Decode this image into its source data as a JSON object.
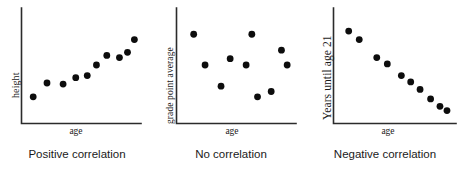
{
  "chart_data": [
    {
      "type": "scatter",
      "title": "Positive correlation",
      "xlabel": "age",
      "ylabel": "height",
      "xlim": [
        0,
        100
      ],
      "ylim": [
        0,
        100
      ],
      "grid": false,
      "legend": "none",
      "points": [
        {
          "x": 8,
          "y": 20
        },
        {
          "x": 20,
          "y": 33
        },
        {
          "x": 34,
          "y": 32
        },
        {
          "x": 45,
          "y": 38
        },
        {
          "x": 55,
          "y": 40
        },
        {
          "x": 63,
          "y": 50
        },
        {
          "x": 72,
          "y": 59
        },
        {
          "x": 83,
          "y": 57
        },
        {
          "x": 90,
          "y": 62
        },
        {
          "x": 96,
          "y": 74
        }
      ]
    },
    {
      "type": "scatter",
      "title": "No correlation",
      "xlabel": "age",
      "ylabel": "grade point average",
      "xlim": [
        0,
        100
      ],
      "ylim": [
        0,
        100
      ],
      "grid": false,
      "legend": "none",
      "points": [
        {
          "x": 12,
          "y": 79
        },
        {
          "x": 22,
          "y": 50
        },
        {
          "x": 36,
          "y": 30
        },
        {
          "x": 44,
          "y": 56
        },
        {
          "x": 58,
          "y": 50
        },
        {
          "x": 63,
          "y": 79
        },
        {
          "x": 68,
          "y": 20
        },
        {
          "x": 80,
          "y": 25
        },
        {
          "x": 89,
          "y": 64
        },
        {
          "x": 94,
          "y": 50
        }
      ]
    },
    {
      "type": "scatter",
      "title": "Negative correlation",
      "xlabel": "age",
      "ylabel": "Years until age 21",
      "xlim": [
        0,
        100
      ],
      "ylim": [
        0,
        100
      ],
      "grid": false,
      "legend": "none",
      "points": [
        {
          "x": 10,
          "y": 82
        },
        {
          "x": 19,
          "y": 74
        },
        {
          "x": 34,
          "y": 57
        },
        {
          "x": 43,
          "y": 51
        },
        {
          "x": 55,
          "y": 40
        },
        {
          "x": 63,
          "y": 34
        },
        {
          "x": 71,
          "y": 27
        },
        {
          "x": 80,
          "y": 18
        },
        {
          "x": 88,
          "y": 11
        },
        {
          "x": 94,
          "y": 7
        }
      ]
    }
  ],
  "figure": {
    "dot_color": "#0d0d0d",
    "axis_color": "#2b2b2b",
    "background": "#ffffff"
  }
}
